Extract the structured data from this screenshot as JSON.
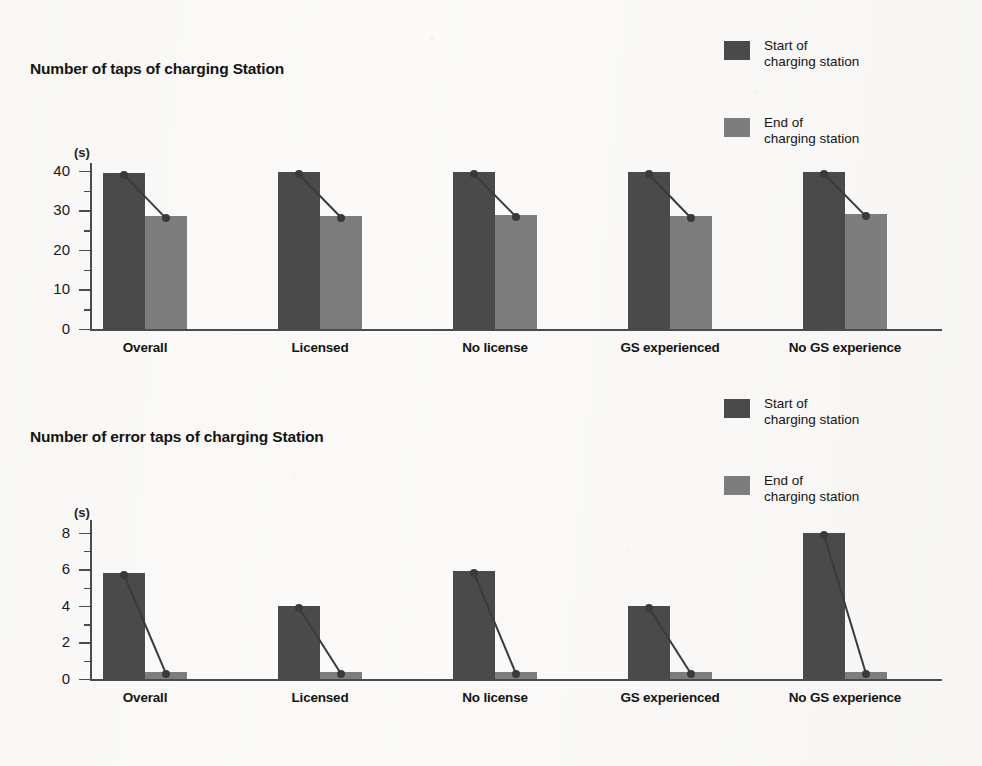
{
  "page": {
    "background_color": "#fbfaf8",
    "series_colors": {
      "start": "#4a4a4a",
      "end": "#7d7d7d"
    },
    "axis_color": "#4b4b4b"
  },
  "legend": {
    "items": [
      {
        "key": "start",
        "label_line1": "Start of",
        "label_line2": "charging station",
        "color": "#4a4a4a"
      },
      {
        "key": "end",
        "label_line1": "End of",
        "label_line2": "charging station",
        "color": "#7d7d7d"
      }
    ]
  },
  "chart_data": [
    {
      "type": "bar",
      "title": "Number of taps of charging Station",
      "xlabel": "",
      "ylabel": "(s)",
      "ylim": [
        0,
        42
      ],
      "yticks": [
        0,
        10,
        20,
        30,
        40
      ],
      "ytick_labels": [
        "0",
        "10",
        "20",
        "30",
        "40"
      ],
      "yminor_step": 5,
      "grid": false,
      "legend_position": "top-right",
      "categories": [
        "Overall",
        "Licensed",
        "No license",
        "GS experienced",
        "No GS experience"
      ],
      "series": [
        {
          "name": "Start of charging station",
          "color": "#4a4a4a",
          "values": [
            39.5,
            39.6,
            39.7,
            39.6,
            39.8
          ]
        },
        {
          "name": "End of charging station",
          "color": "#7d7d7d",
          "values": [
            28.5,
            28.7,
            28.9,
            28.6,
            29.0
          ]
        }
      ]
    },
    {
      "type": "bar",
      "title": "Number of error taps of charging Station",
      "xlabel": "",
      "ylabel": "(s)",
      "ylim": [
        0,
        8.7
      ],
      "yticks": [
        0,
        2,
        4,
        6,
        8
      ],
      "ytick_labels": [
        "0",
        "2",
        "4",
        "6",
        "8"
      ],
      "yminor_step": 1,
      "grid": false,
      "legend_position": "top-right",
      "categories": [
        "Overall",
        "Licensed",
        "No license",
        "GS experienced",
        "No GS experience"
      ],
      "series": [
        {
          "name": "Start of charging station",
          "color": "#4a4a4a",
          "values": [
            5.8,
            4.0,
            5.9,
            4.0,
            8.0
          ]
        },
        {
          "name": "End of charging station",
          "color": "#7d7d7d",
          "values": [
            0.4,
            0.4,
            0.4,
            0.4,
            0.4
          ]
        }
      ]
    }
  ]
}
